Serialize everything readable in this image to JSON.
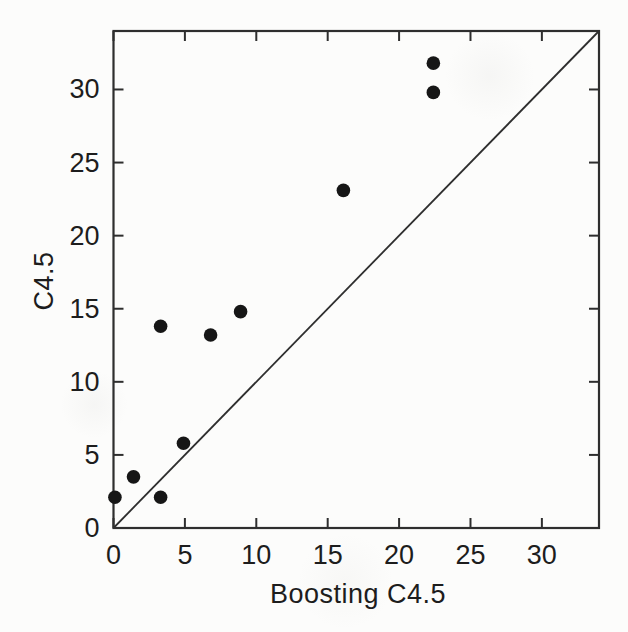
{
  "chart_data": {
    "type": "scatter",
    "title": "",
    "xlabel": "Boosting C4.5",
    "ylabel": "C4.5",
    "xlim": [
      0,
      34
    ],
    "ylim": [
      0,
      34
    ],
    "xticks": [
      0,
      5,
      10,
      15,
      20,
      25,
      30
    ],
    "yticks": [
      0,
      5,
      10,
      15,
      20,
      25,
      30
    ],
    "grid": false,
    "legend": "none",
    "points": [
      {
        "x": 0.1,
        "y": 2.1
      },
      {
        "x": 1.4,
        "y": 3.5
      },
      {
        "x": 3.3,
        "y": 2.1
      },
      {
        "x": 3.3,
        "y": 13.8
      },
      {
        "x": 4.9,
        "y": 5.8
      },
      {
        "x": 6.8,
        "y": 13.2
      },
      {
        "x": 8.9,
        "y": 14.8
      },
      {
        "x": 16.1,
        "y": 23.1
      },
      {
        "x": 22.4,
        "y": 29.8
      },
      {
        "x": 22.4,
        "y": 31.8
      }
    ],
    "reference_line": {
      "label": "y = x",
      "from": [
        0,
        0
      ],
      "to": [
        34,
        34
      ]
    },
    "colors": {
      "marker": "#161616",
      "axis": "#2e2e2e",
      "reference_line": "#2e2e2e",
      "text": "#1d1d1d",
      "background": "#fcfcfb"
    }
  }
}
